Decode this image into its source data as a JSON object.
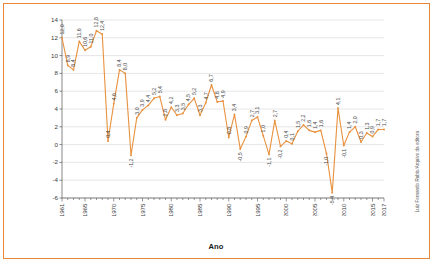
{
  "chart_data": {
    "type": "line",
    "title": "",
    "xlabel": "Ano",
    "ylabel": "Taxa de crescimento (em %)",
    "ylim": [
      -6,
      14
    ],
    "yticks": [
      -6,
      -4,
      -2,
      0,
      2,
      4,
      6,
      8,
      10,
      12,
      14
    ],
    "xlim": [
      1961,
      2017
    ],
    "xticks": [
      1961,
      1965,
      1970,
      1975,
      1980,
      1985,
      1990,
      1995,
      2000,
      2005,
      2010,
      2015,
      2017
    ],
    "grid": true,
    "legend": "none",
    "series_color": "#E8913E",
    "x": [
      1961,
      1962,
      1963,
      1964,
      1965,
      1966,
      1967,
      1968,
      1969,
      1970,
      1971,
      1972,
      1973,
      1974,
      1975,
      1976,
      1977,
      1978,
      1979,
      1980,
      1981,
      1982,
      1983,
      1984,
      1985,
      1986,
      1987,
      1988,
      1989,
      1990,
      1991,
      1992,
      1993,
      1994,
      1995,
      1996,
      1997,
      1998,
      1999,
      2000,
      2001,
      2002,
      2003,
      2004,
      2005,
      2006,
      2007,
      2008,
      2009,
      2010,
      2011,
      2012,
      2013,
      2014,
      2015,
      2016,
      2017
    ],
    "values": [
      12.0,
      8.9,
      8.4,
      11.6,
      10.6,
      11.0,
      12.8,
      12.4,
      0.4,
      4.6,
      8.4,
      8.0,
      -1.2,
      3.0,
      3.9,
      4.4,
      5.2,
      5.4,
      2.8,
      4.2,
      3.3,
      3.5,
      4.5,
      5.2,
      3.3,
      4.7,
      6.7,
      4.8,
      4.9,
      0.8,
      3.4,
      -0.5,
      0.9,
      2.7,
      3.1,
      1.0,
      -1.1,
      2.7,
      -0.2,
      0.4,
      0.1,
      1.5,
      2.2,
      1.6,
      1.4,
      1.6,
      -1.0,
      -5.4,
      4.1,
      -0.1,
      1.4,
      2.0,
      0.3,
      1.3,
      0.9,
      1.7,
      1.7
    ],
    "point_labels": [
      "12,0",
      "8,9",
      "8,4",
      "11,6",
      "10,6",
      "11,0",
      "12,8",
      "12,4",
      "0,4",
      "4,6",
      "8,4",
      "8,0",
      "-1,2",
      "3,0",
      "3,9",
      "4,4",
      "5,2",
      "5,4",
      "2,8",
      "4,2",
      "3,3",
      "3,5",
      "4,5",
      "5,2",
      "3,3",
      "4,7",
      "6,7",
      "4,8",
      "4,9",
      "0,8",
      "3,4",
      "-0,5",
      "0,9",
      "2,7",
      "3,1",
      "1,0",
      "-1,1",
      "2,7",
      "-0,2",
      "0,4",
      "0,1",
      "1,5",
      "2,2",
      "1,6",
      "1,4",
      "1,6",
      "-1,0",
      "-5,4",
      "4,1",
      "-0,1",
      "1,4",
      "2,0",
      "0,3",
      "1,3",
      "0,9",
      "1,7",
      "1,7"
    ],
    "ytick_labels": [
      "-6",
      "-4",
      "-2",
      "0",
      "2",
      "4",
      "6",
      "8",
      "10",
      "12",
      "14"
    ],
    "xtick_labels": [
      "1961",
      "1965",
      "1970",
      "1975",
      "1980",
      "1985",
      "1990",
      "1995",
      "2000",
      "2005",
      "2010",
      "2015",
      "2017"
    ]
  },
  "credit": "Luiz Fernando Rubio/Arquivo da editora"
}
